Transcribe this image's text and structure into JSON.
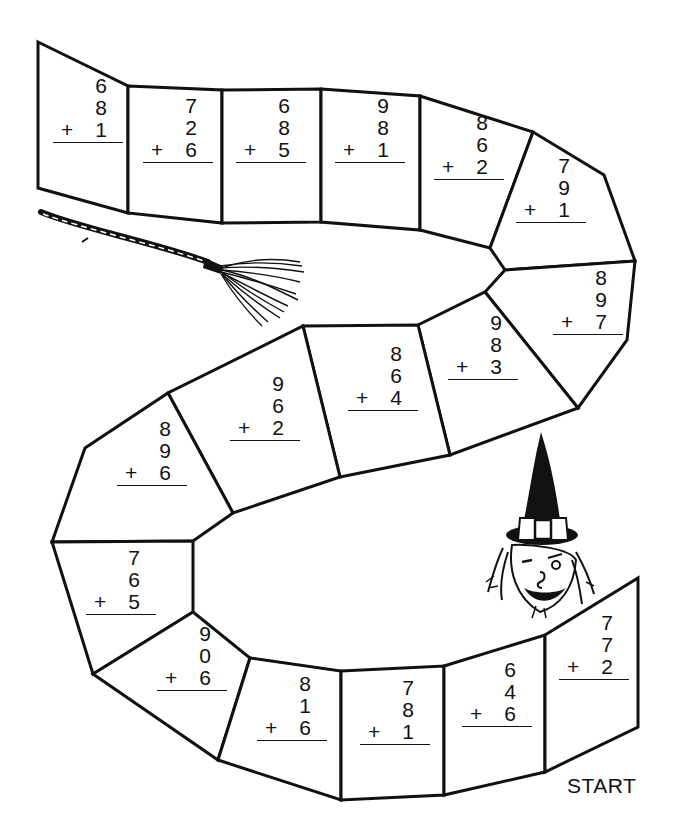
{
  "board": {
    "start_label": "START",
    "cells": [
      {
        "a": "6",
        "b": "8",
        "op": "+",
        "c": "1",
        "pos": [
          53,
          75
        ]
      },
      {
        "a": "7",
        "b": "2",
        "op": "+",
        "c": "6",
        "pos": [
          143,
          95
        ]
      },
      {
        "a": "6",
        "b": "8",
        "op": "+",
        "c": "5",
        "pos": [
          236,
          95
        ]
      },
      {
        "a": "9",
        "b": "8",
        "op": "+",
        "c": "1",
        "pos": [
          335,
          95
        ]
      },
      {
        "a": "8",
        "b": "6",
        "op": "+",
        "c": "2",
        "pos": [
          434,
          112
        ]
      },
      {
        "a": "7",
        "b": "9",
        "op": "+",
        "c": "1",
        "pos": [
          516,
          155
        ]
      },
      {
        "a": "8",
        "b": "9",
        "op": "+",
        "c": "7",
        "pos": [
          553,
          267
        ]
      },
      {
        "a": "9",
        "b": "8",
        "op": "+",
        "c": "3",
        "pos": [
          448,
          312
        ]
      },
      {
        "a": "8",
        "b": "6",
        "op": "+",
        "c": "4",
        "pos": [
          348,
          343
        ]
      },
      {
        "a": "9",
        "b": "6",
        "op": "+",
        "c": "2",
        "pos": [
          230,
          373
        ]
      },
      {
        "a": "8",
        "b": "9",
        "op": "+",
        "c": "6",
        "pos": [
          117,
          418
        ]
      },
      {
        "a": "7",
        "b": "6",
        "op": "+",
        "c": "5",
        "pos": [
          86,
          547
        ]
      },
      {
        "a": "9",
        "b": "0",
        "op": "+",
        "c": "6",
        "pos": [
          157,
          623
        ]
      },
      {
        "a": "8",
        "b": "1",
        "op": "+",
        "c": "6",
        "pos": [
          257,
          673
        ]
      },
      {
        "a": "7",
        "b": "8",
        "op": "+",
        "c": "1",
        "pos": [
          360,
          677
        ]
      },
      {
        "a": "6",
        "b": "4",
        "op": "+",
        "c": "6",
        "pos": [
          462,
          659
        ]
      },
      {
        "a": "7",
        "b": "7",
        "op": "+",
        "c": "2",
        "pos": [
          559,
          612
        ]
      }
    ]
  },
  "illustrations": {
    "witch": "witch-head-icon",
    "broom": "broom-icon"
  },
  "colors": {
    "ink": "#111111",
    "paper": "#ffffff"
  }
}
